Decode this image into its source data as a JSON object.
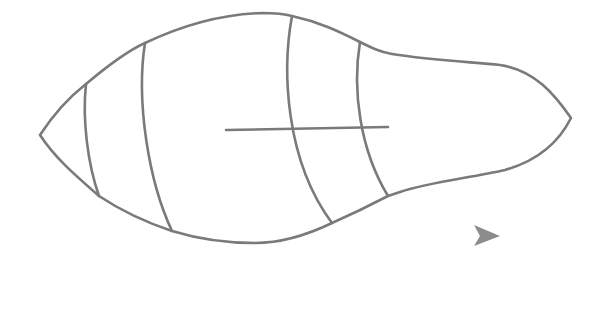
{
  "drawing": {
    "description": "line drawing outline of an elongated gourd-like shape divided by curved stripes with a horizontal line",
    "stroke_color": "#7a7a7a",
    "background_color": "#ffffff",
    "stripe_count": 4
  },
  "cursor": {
    "icon": "arrow-pointer-icon",
    "color": "#8c8c8c"
  }
}
